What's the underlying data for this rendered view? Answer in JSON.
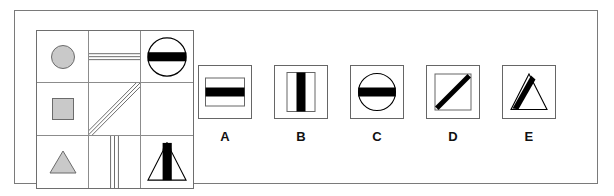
{
  "item": {
    "type": "matrix-reasoning",
    "frame_border_color": "#7a7a7a",
    "background_color": "#ffffff",
    "ink_color": "#000000",
    "gray_fill_color": "#c9c9c9",
    "grid_line_color": "#8c8c8c"
  },
  "matrix": {
    "name": "3x3-matrix",
    "rows": 3,
    "columns": 3,
    "cells": [
      {
        "id": "r1c1",
        "row": 1,
        "column": 1,
        "content": "gray-circle",
        "description": "small gray filled circle",
        "is_missing": false
      },
      {
        "id": "r1c2",
        "row": 1,
        "column": 2,
        "content": "horizontal-lines",
        "description": "three thin horizontal parallel lines",
        "line_count": 3,
        "is_missing": false
      },
      {
        "id": "r1c3",
        "row": 1,
        "column": 3,
        "content": "circle-with-horizontal-bar",
        "description": "outline circle crossed by a thick black horizontal bar",
        "is_missing": false
      },
      {
        "id": "r2c1",
        "row": 2,
        "column": 1,
        "content": "gray-square",
        "description": "small gray filled square",
        "is_missing": false
      },
      {
        "id": "r2c2",
        "row": 2,
        "column": 2,
        "content": "diagonal-lines",
        "description": "three thin diagonal parallel lines rising left to right",
        "line_count": 3,
        "is_missing": false
      },
      {
        "id": "r2c3",
        "row": 2,
        "column": 3,
        "content": "empty",
        "description": "blank cell - the missing piece to be solved",
        "is_missing": true
      },
      {
        "id": "r3c1",
        "row": 3,
        "column": 1,
        "content": "gray-triangle",
        "description": "small gray filled triangle",
        "is_missing": false
      },
      {
        "id": "r3c2",
        "row": 3,
        "column": 2,
        "content": "vertical-lines",
        "description": "three thin vertical parallel lines",
        "line_count": 3,
        "is_missing": false
      },
      {
        "id": "r3c3",
        "row": 3,
        "column": 3,
        "content": "triangle-with-vertical-bar",
        "description": "outline triangle crossed by a thick black vertical bar",
        "is_missing": false
      }
    ]
  },
  "options": [
    {
      "label": "A",
      "art": "rectangle-with-horizontal-bar",
      "description": "outline rectangle crossed by a thick black horizontal bar"
    },
    {
      "label": "B",
      "art": "rectangle-with-vertical-bar",
      "description": "outline rectangle crossed by a thick black vertical bar"
    },
    {
      "label": "C",
      "art": "circle-with-horizontal-bar",
      "description": "outline circle crossed by a thick black horizontal bar"
    },
    {
      "label": "D",
      "art": "square-with-diagonal-bar",
      "description": "outline square crossed by a thick black diagonal bar"
    },
    {
      "label": "E",
      "art": "triangle-with-diagonal-bar",
      "description": "outline triangle crossed by a thick black diagonal bar"
    }
  ]
}
